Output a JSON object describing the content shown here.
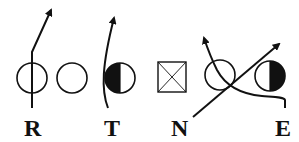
{
  "diagram": {
    "type": "football-play",
    "colors": {
      "ink": "#111111",
      "background": "#ffffff"
    },
    "players": [
      {
        "id": "R",
        "label": "R",
        "symbol": "open-circle"
      },
      {
        "id": "G",
        "label": "",
        "symbol": "open-circle"
      },
      {
        "id": "T",
        "label": "T",
        "symbol": "half-filled-circle-left"
      },
      {
        "id": "N",
        "label": "N",
        "symbol": "box-with-x"
      },
      {
        "id": "O",
        "label": "",
        "symbol": "open-circle"
      },
      {
        "id": "E",
        "label": "E",
        "symbol": "half-filled-circle-right"
      }
    ],
    "labels": {
      "r": "R",
      "t": "T",
      "n": "N",
      "e": "E"
    }
  }
}
